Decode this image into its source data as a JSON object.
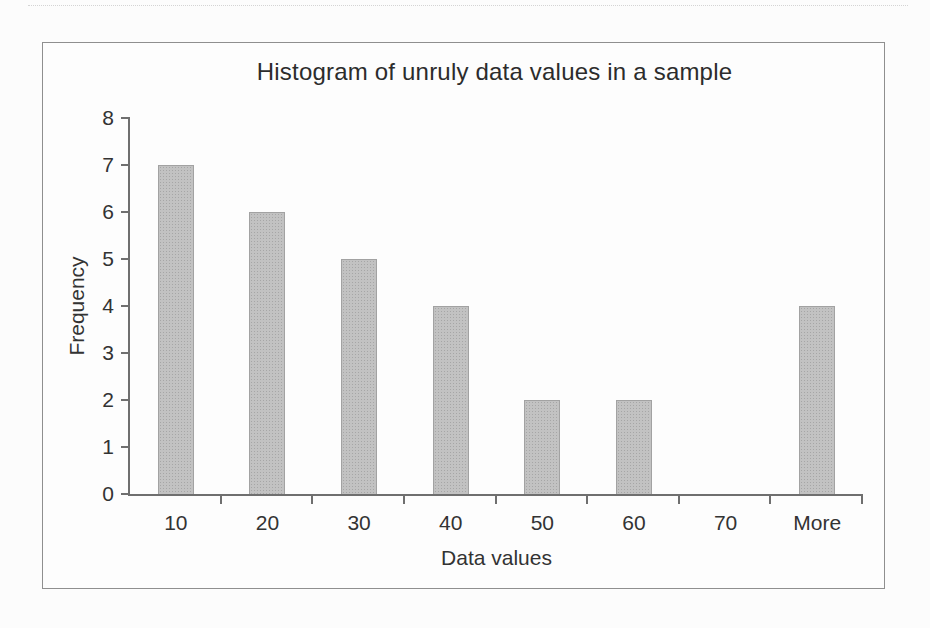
{
  "page": {
    "background": "#fcfcfc",
    "frame_border_color": "#8f8f8f"
  },
  "chart_data": {
    "type": "bar",
    "title": "Histogram of unruly data values in a sample",
    "xlabel": "Data values",
    "ylabel": "Frequency",
    "categories": [
      "10",
      "20",
      "30",
      "40",
      "50",
      "60",
      "70",
      "More"
    ],
    "values": [
      7,
      6,
      5,
      4,
      2,
      2,
      0,
      4
    ],
    "ylim": [
      0,
      8
    ],
    "ytick_step": 1,
    "grid": "off",
    "legend": "none",
    "bar_color": "#c2c2c2",
    "bar_dot_color": "#a6a6a6",
    "axis_color": "#6f6f6f",
    "text_color": "#333333"
  }
}
